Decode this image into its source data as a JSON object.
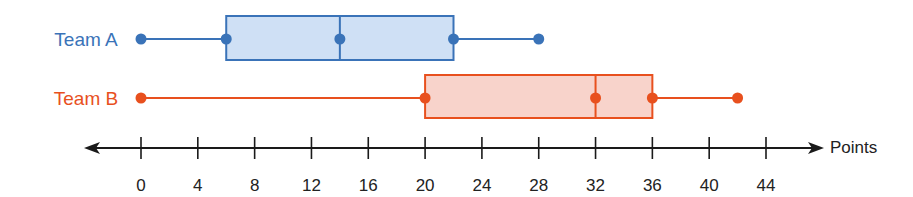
{
  "chart_data": {
    "type": "boxplot",
    "title": "",
    "xlabel": "Points",
    "ylabel": "",
    "xlim": [
      0,
      44
    ],
    "ticks": [
      0,
      4,
      8,
      12,
      16,
      20,
      24,
      28,
      32,
      36,
      40,
      44
    ],
    "tick_labels": [
      "0",
      "4",
      "8",
      "12",
      "16",
      "20",
      "24",
      "28",
      "32",
      "36",
      "40",
      "44"
    ],
    "grid": false,
    "legend": null,
    "series": [
      {
        "name": "Team A",
        "color": "#3a73b8",
        "fill": "#cfe0f5",
        "min": 0,
        "q1": 6,
        "median": 14,
        "q3": 22,
        "max": 28
      },
      {
        "name": "Team B",
        "color": "#e8501e",
        "fill": "#f8d3cb",
        "min": 0,
        "q1": 20,
        "median": 32,
        "q3": 36,
        "max": 42
      }
    ]
  }
}
